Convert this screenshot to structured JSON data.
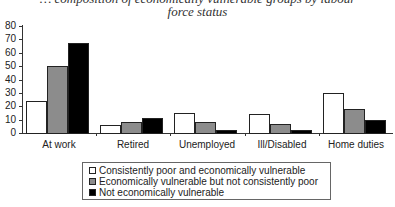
{
  "chart_data": {
    "type": "bar",
    "title_lines": [
      "… composition of economically vulnerable groups by labour",
      "force status"
    ],
    "xlabel": "",
    "ylabel": "",
    "ylim": [
      0,
      80
    ],
    "yticks": [
      0,
      10,
      20,
      30,
      40,
      50,
      60,
      70,
      80
    ],
    "grid": false,
    "legend_position": "bottom",
    "categories": [
      "At work",
      "Retired",
      "Unemployed",
      "Ill/Disabled",
      "Home duties"
    ],
    "series": [
      {
        "name": "Consistently poor and economically vulnerable",
        "color": "#ffffff",
        "values": [
          24,
          6,
          15,
          14,
          30
        ]
      },
      {
        "name": "Economically vulnerable but not consistently poor",
        "color": "#8c8c8c",
        "values": [
          50,
          8,
          8,
          7,
          18
        ]
      },
      {
        "name": "Not economically vulnerable",
        "color": "#000000",
        "values": [
          67,
          11,
          2,
          2,
          10
        ]
      }
    ]
  }
}
